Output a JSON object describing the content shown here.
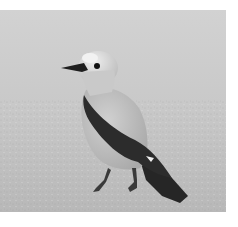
{
  "image": {
    "subject": "bird",
    "description": "Grayscale photograph of a Clark's nutcracker standing on gravel ground",
    "tone": "grayscale",
    "colors": {
      "background_top": "#cfcfcf",
      "background_bottom": "#bdbdbd",
      "body": "#c4c4c4",
      "head": "#dedede",
      "wing": "#2a2a2a",
      "beak": "#1e1e1e",
      "margin": "#ffffff"
    }
  }
}
